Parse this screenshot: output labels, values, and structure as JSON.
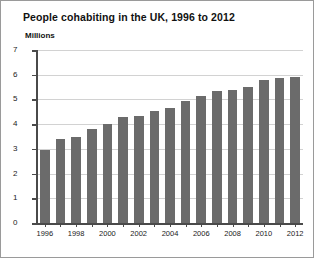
{
  "chart_data": {
    "type": "bar",
    "title": "People cohabiting in the UK, 1996 to 2012",
    "xlabel": "",
    "ylabel": "Millions",
    "ylim": [
      0,
      7
    ],
    "yticks": [
      0,
      1,
      2,
      3,
      4,
      5,
      6,
      7
    ],
    "grid": true,
    "legend": "none",
    "bar_color": "#6b6b6b",
    "gridline_color": "#d2d2d2",
    "axis_color": "#4a4a4a",
    "categories": [
      "1996",
      "1997",
      "1998",
      "1999",
      "2000",
      "2001",
      "2002",
      "2003",
      "2004",
      "2005",
      "2006",
      "2007",
      "2008",
      "2009",
      "2010",
      "2011",
      "2012"
    ],
    "visible_xtick_labels": [
      "1996",
      "1998",
      "2000",
      "2002",
      "2004",
      "2006",
      "2008",
      "2010",
      "2012"
    ],
    "values": [
      2.95,
      3.4,
      3.5,
      3.8,
      4.0,
      4.3,
      4.35,
      4.55,
      4.65,
      4.95,
      5.15,
      5.35,
      5.4,
      5.5,
      5.8,
      5.85,
      5.9
    ]
  }
}
